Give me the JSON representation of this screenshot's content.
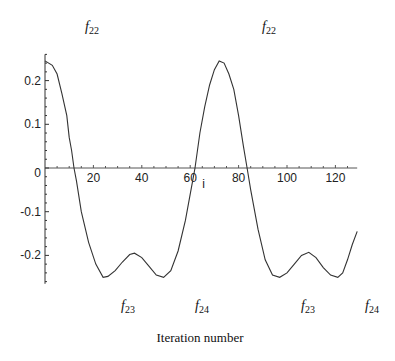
{
  "chart_data": {
    "type": "line",
    "title": "",
    "xlabel": "Iteration number",
    "ylabel": "",
    "xlim": [
      0,
      129
    ],
    "ylim": [
      -0.265,
      0.26
    ],
    "grid": false,
    "x_ticks": [
      20,
      40,
      60,
      80,
      100,
      120
    ],
    "y_ticks": [
      0.2,
      0.1,
      0,
      -0.1,
      -0.2
    ],
    "y_tick_labels": [
      "0.2",
      "0.1",
      "0",
      "-0.1",
      "-0.2"
    ],
    "axis_marker": "i",
    "series": [
      {
        "name": "curve",
        "color": "#333333",
        "x": [
          0,
          3,
          5,
          7,
          9,
          10,
          11,
          12,
          13,
          15,
          18,
          21,
          24,
          26,
          29,
          32,
          35,
          37,
          40,
          43,
          46,
          49,
          52,
          55,
          58,
          61,
          62,
          64,
          66,
          68,
          70,
          72,
          74,
          76,
          78,
          80,
          82,
          83.5,
          85,
          88,
          91,
          94,
          97,
          100,
          103,
          106,
          109,
          112,
          115,
          118,
          121,
          123,
          125,
          127,
          129
        ],
        "values": [
          0.245,
          0.235,
          0.215,
          0.17,
          0.12,
          0.07,
          0.04,
          0.0,
          -0.03,
          -0.1,
          -0.17,
          -0.22,
          -0.25,
          -0.248,
          -0.235,
          -0.215,
          -0.198,
          -0.195,
          -0.205,
          -0.225,
          -0.245,
          -0.25,
          -0.235,
          -0.19,
          -0.12,
          -0.03,
          0.0,
          0.08,
          0.14,
          0.19,
          0.225,
          0.245,
          0.24,
          0.215,
          0.18,
          0.12,
          0.05,
          0.0,
          -0.05,
          -0.14,
          -0.21,
          -0.245,
          -0.25,
          -0.24,
          -0.22,
          -0.2,
          -0.193,
          -0.205,
          -0.228,
          -0.245,
          -0.25,
          -0.24,
          -0.21,
          -0.175,
          -0.145
        ]
      }
    ],
    "annotations": [
      {
        "text": "f",
        "sub": "22",
        "position": "top",
        "x_px": 85,
        "y_px": 31
      },
      {
        "text": "f",
        "sub": "22",
        "position": "top",
        "x_px": 262,
        "y_px": 31
      },
      {
        "text": "f",
        "sub": "23",
        "position": "bottom",
        "x_px": 121,
        "y_px": 310
      },
      {
        "text": "f",
        "sub": "24",
        "position": "bottom",
        "x_px": 195,
        "y_px": 310
      },
      {
        "text": "f",
        "sub": "23",
        "position": "bottom",
        "x_px": 301,
        "y_px": 310
      },
      {
        "text": "f",
        "sub": "24",
        "position": "bottom",
        "x_px": 365,
        "y_px": 310
      }
    ]
  }
}
